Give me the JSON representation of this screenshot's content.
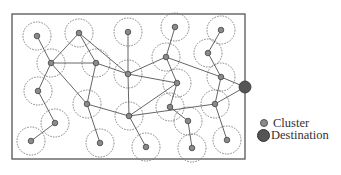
{
  "figure": {
    "width": 341,
    "height": 175,
    "frame": {
      "x": 12,
      "y": 14,
      "w": 233,
      "h": 145
    },
    "colors": {
      "frame": "#555555",
      "edge": "#555555",
      "range_circle": "#777777",
      "cluster_fill": "#8a8a8a",
      "cluster_stroke": "#444444",
      "destination_fill": "#555555"
    },
    "range_radius": 14,
    "clusters": [
      {
        "id": "c1",
        "x": 37,
        "y": 36
      },
      {
        "id": "c2",
        "x": 79,
        "y": 33
      },
      {
        "id": "c3",
        "x": 128,
        "y": 32
      },
      {
        "id": "c4",
        "x": 175,
        "y": 27
      },
      {
        "id": "c5",
        "x": 221,
        "y": 30
      },
      {
        "id": "c6",
        "x": 51,
        "y": 63
      },
      {
        "id": "c7",
        "x": 96,
        "y": 63
      },
      {
        "id": "c8",
        "x": 128,
        "y": 74
      },
      {
        "id": "c9",
        "x": 166,
        "y": 57
      },
      {
        "id": "c10",
        "x": 208,
        "y": 53
      },
      {
        "id": "c11",
        "x": 177,
        "y": 83
      },
      {
        "id": "c12",
        "x": 221,
        "y": 77
      },
      {
        "id": "c13",
        "x": 38,
        "y": 91
      },
      {
        "id": "c14",
        "x": 87,
        "y": 104
      },
      {
        "id": "c15",
        "x": 129,
        "y": 116
      },
      {
        "id": "c16",
        "x": 170,
        "y": 107
      },
      {
        "id": "c17",
        "x": 215,
        "y": 104
      },
      {
        "id": "c18",
        "x": 55,
        "y": 123
      },
      {
        "id": "c19",
        "x": 188,
        "y": 121
      },
      {
        "id": "c20",
        "x": 31,
        "y": 141
      },
      {
        "id": "c21",
        "x": 100,
        "y": 143
      },
      {
        "id": "c22",
        "x": 146,
        "y": 147
      },
      {
        "id": "c23",
        "x": 192,
        "y": 148
      },
      {
        "id": "c24",
        "x": 227,
        "y": 140
      }
    ],
    "destination": {
      "id": "dest",
      "x": 245,
      "y": 87,
      "r": 6
    },
    "edges": [
      [
        "c1",
        "c6"
      ],
      [
        "c2",
        "c6"
      ],
      [
        "c2",
        "c7"
      ],
      [
        "c2",
        "c8"
      ],
      [
        "c6",
        "c7"
      ],
      [
        "c6",
        "c13"
      ],
      [
        "c6",
        "c14"
      ],
      [
        "c7",
        "c8"
      ],
      [
        "c7",
        "c14"
      ],
      [
        "c3",
        "c8"
      ],
      [
        "c4",
        "c9"
      ],
      [
        "c9",
        "c8"
      ],
      [
        "c9",
        "c12"
      ],
      [
        "c9",
        "c11"
      ],
      [
        "c5",
        "c10"
      ],
      [
        "c10",
        "c12"
      ],
      [
        "c8",
        "c11"
      ],
      [
        "c8",
        "c15"
      ],
      [
        "c11",
        "c16"
      ],
      [
        "c11",
        "c15"
      ],
      [
        "c12",
        "dest"
      ],
      [
        "c12",
        "c17"
      ],
      [
        "c17",
        "dest"
      ],
      [
        "c15",
        "c17"
      ],
      [
        "c14",
        "c15"
      ],
      [
        "c14",
        "c21"
      ],
      [
        "c15",
        "c22"
      ],
      [
        "c16",
        "c19"
      ],
      [
        "c19",
        "c23"
      ],
      [
        "c17",
        "c24"
      ],
      [
        "c13",
        "c18"
      ],
      [
        "c18",
        "c20"
      ]
    ]
  },
  "legend": {
    "items": [
      {
        "label": "Cluster",
        "symbol": "small-gray-dot"
      },
      {
        "label": "Destination",
        "symbol": "large-dark-dot"
      }
    ]
  }
}
